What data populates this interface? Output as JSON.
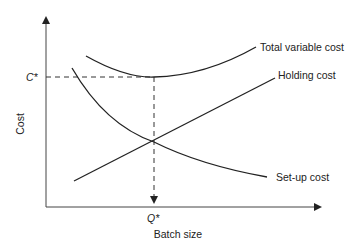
{
  "diagram": {
    "title": "",
    "y_axis_label": "Cost",
    "x_axis_label": "Batch size",
    "optimum_cost_label": "C*",
    "optimum_qty_label": "Q*",
    "curves": [
      {
        "name": "Total variable cost",
        "label": "Total variable cost"
      },
      {
        "name": "Holding cost",
        "label": "Holding cost"
      },
      {
        "name": "Set-up cost",
        "label": "Set-up cost"
      }
    ],
    "colors": {
      "line": "#222222",
      "background": "#ffffff"
    }
  }
}
